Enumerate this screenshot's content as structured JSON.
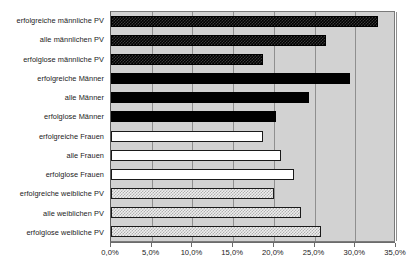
{
  "chart_data": {
    "type": "bar",
    "orientation": "horizontal",
    "title": "",
    "xlabel": "",
    "ylabel": "",
    "xlim": [
      0,
      35
    ],
    "xtick_labels": [
      "0,0%",
      "5,0%",
      "10,0%",
      "15,0%",
      "20,0%",
      "25,0%",
      "30,0%",
      "35,0%"
    ],
    "xtick_values": [
      0,
      5,
      10,
      15,
      20,
      25,
      30,
      35
    ],
    "grid": true,
    "legend": "none",
    "plot_background": "#d2d2d2",
    "categories": [
      "erfolgreiche männliche PV",
      "alle männlichen PV",
      "erfolglose männliche PV",
      "erfolgreiche Männer",
      "alle Männer",
      "erfolglose Männer",
      "erfolgreiche Frauen",
      "alle Frauen",
      "erfolglose Frauen",
      "erfolgreiche weibliche PV",
      "alle weiblichen PV",
      "erfolglose weibliche PV"
    ],
    "values": [
      32.8,
      26.4,
      18.7,
      29.4,
      24.3,
      20.3,
      18.7,
      20.9,
      22.5,
      20.0,
      23.3,
      25.8
    ],
    "bar_styles": [
      "dark-check",
      "dark-check",
      "dark-check",
      "solid-black",
      "solid-black",
      "solid-black",
      "solid-white",
      "solid-white",
      "solid-white",
      "light-check",
      "light-check",
      "light-check"
    ],
    "series_groups": [
      {
        "name": "männliche PV",
        "style": "dark-check",
        "fill": "#000000"
      },
      {
        "name": "Männer",
        "style": "solid-black",
        "fill": "#000000"
      },
      {
        "name": "Frauen",
        "style": "solid-white",
        "fill": "#ffffff"
      },
      {
        "name": "weibliche PV",
        "style": "light-check",
        "fill": "#efefef"
      }
    ]
  }
}
